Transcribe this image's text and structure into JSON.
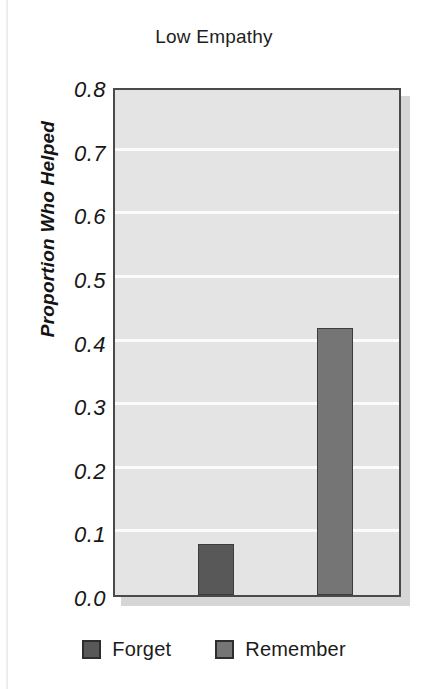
{
  "chart_data": {
    "type": "bar",
    "title": "Low Empathy",
    "xlabel": "",
    "ylabel": "Proportion Who Helped",
    "ylim": [
      0.0,
      0.8
    ],
    "ytick_labels": [
      "0.8",
      "0.7",
      "0.6",
      "0.5",
      "0.4",
      "0.3",
      "0.2",
      "0.1",
      "0.0"
    ],
    "ytick_values": [
      0.8,
      0.7,
      0.6,
      0.5,
      0.4,
      0.3,
      0.2,
      0.1,
      0.0
    ],
    "grid": true,
    "legend_position": "bottom",
    "categories": [
      ""
    ],
    "series": [
      {
        "name": "Forget",
        "values": [
          0.08
        ],
        "color": "#585858"
      },
      {
        "name": "Remember",
        "values": [
          0.42
        ],
        "color": "#757575"
      }
    ]
  },
  "legend": {
    "items": [
      {
        "label": "Forget",
        "color": "#585858"
      },
      {
        "label": "Remember",
        "color": "#757575"
      }
    ]
  },
  "colors": {
    "plot_background": "#e4e4e4",
    "gridline": "#fbfbfb",
    "axis_border": "#4a4a4a",
    "forget": "#585858",
    "remember": "#757575"
  }
}
